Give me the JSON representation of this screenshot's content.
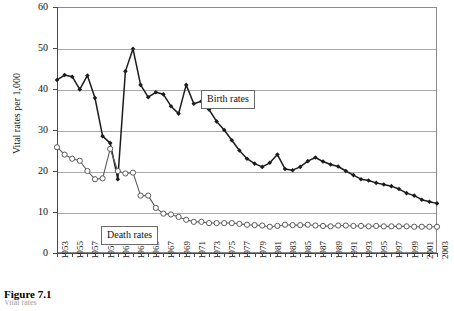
{
  "figure": {
    "caption": "Figure 7.1",
    "subcaption": "Vital rates"
  },
  "legend": {
    "birth_label": "Birth rates",
    "death_label": "Death rates"
  },
  "axis": {
    "y_title": "Vital rates per 1,000",
    "y_ticks": [
      "0",
      "10",
      "20",
      "30",
      "40",
      "50",
      "60"
    ]
  },
  "colors": {
    "birth_series": "#1c1c1c",
    "death_series": "#5a5a5a",
    "gridline": "#a8a8a8",
    "frame": "#8a8a8a",
    "background": "#ffffff"
  },
  "chart_data": {
    "type": "line",
    "title": "Figure 7.1",
    "xlabel": "",
    "ylabel": "Vital rates per 1,000",
    "xlim": [
      1953,
      2003
    ],
    "ylim": [
      0,
      60
    ],
    "grid": true,
    "legend_position": "inline-callout",
    "x": [
      1953,
      1954,
      1955,
      1956,
      1957,
      1958,
      1959,
      1960,
      1961,
      1962,
      1963,
      1964,
      1965,
      1966,
      1967,
      1968,
      1969,
      1970,
      1971,
      1972,
      1973,
      1974,
      1975,
      1976,
      1977,
      1978,
      1979,
      1980,
      1981,
      1982,
      1983,
      1984,
      1985,
      1986,
      1987,
      1988,
      1989,
      1990,
      1991,
      1992,
      1993,
      1994,
      1995,
      1996,
      1997,
      1998,
      1999,
      2000,
      2001,
      2002,
      2003
    ],
    "x_tick_labels": [
      "1953",
      "1955",
      "1957",
      "1959",
      "1961",
      "1963",
      "1965",
      "1967",
      "1969",
      "1971",
      "1973",
      "1975",
      "1977",
      "1979",
      "1981",
      "1983",
      "1985",
      "1987",
      "1989",
      "1991",
      "1993",
      "1995",
      "1997",
      "1999",
      "2001",
      "2003"
    ],
    "series": [
      {
        "name": "Birth rates",
        "marker": "filled-diamond",
        "values": [
          42.2,
          43.4,
          43.0,
          39.9,
          43.3,
          37.8,
          28.5,
          26.8,
          18.0,
          44.3,
          49.8,
          41.0,
          38.0,
          39.2,
          38.7,
          35.8,
          34.0,
          41.0,
          36.4,
          37.0,
          35.0,
          32.1,
          30.0,
          27.5,
          25.0,
          23.0,
          21.8,
          21.0,
          22.0,
          24.0,
          20.5,
          20.2,
          21.0,
          22.4,
          23.3,
          22.3,
          21.6,
          21.1,
          20.0,
          19.0,
          18.0,
          17.7,
          17.1,
          16.7,
          16.3,
          15.6,
          14.6,
          14.0,
          13.0,
          12.5,
          12.1
        ]
      },
      {
        "name": "Death rates",
        "marker": "open-circle",
        "values": [
          25.8,
          24.0,
          23.0,
          22.5,
          20.0,
          18.0,
          18.2,
          25.4,
          20.0,
          19.4,
          19.6,
          14.0,
          14.0,
          11.0,
          9.6,
          9.4,
          8.8,
          8.1,
          7.6,
          7.6,
          7.3,
          7.3,
          7.3,
          7.3,
          7.1,
          6.9,
          6.8,
          6.7,
          6.4,
          6.6,
          6.9,
          6.8,
          6.8,
          6.9,
          6.7,
          6.6,
          6.5,
          6.7,
          6.7,
          6.6,
          6.6,
          6.5,
          6.6,
          6.5,
          6.5,
          6.5,
          6.5,
          6.4,
          6.4,
          6.4,
          6.4
        ]
      }
    ]
  }
}
